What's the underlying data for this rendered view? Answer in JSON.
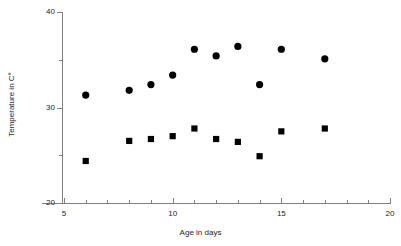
{
  "chart_data": {
    "type": "scatter",
    "title": "",
    "xlabel": "Age in days",
    "ylabel": "Temperature in C°",
    "xlim": [
      4,
      20
    ],
    "ylim": [
      20,
      40
    ],
    "grid": false,
    "legend": "none",
    "x_ticks_major": [
      5,
      10,
      15,
      20
    ],
    "x_tick_labels": [
      "5",
      "10",
      "15",
      "20"
    ],
    "x_ticks_minor": [
      6,
      7,
      8,
      9,
      11,
      12,
      13,
      14,
      16,
      17,
      18,
      19
    ],
    "y_ticks_major": [
      20,
      30,
      40
    ],
    "y_tick_labels": [
      "20",
      "30",
      "40"
    ],
    "y_ticks_minor": [
      25,
      35
    ],
    "marker_color": "#000000",
    "axis_color": "#808080",
    "series": [
      {
        "name": "circles",
        "marker": "circle",
        "x": [
          6,
          8,
          9,
          10,
          11,
          12,
          13,
          14,
          15,
          17
        ],
        "values": [
          31.3,
          31.8,
          32.4,
          33.4,
          36.1,
          35.4,
          36.4,
          32.4,
          36.1,
          35.1
        ]
      },
      {
        "name": "squares",
        "marker": "square",
        "x": [
          6,
          8,
          9,
          10,
          11,
          12,
          13,
          14,
          15,
          17
        ],
        "values": [
          24.4,
          26.5,
          26.7,
          27.0,
          27.8,
          26.7,
          26.4,
          24.9,
          27.5,
          27.8
        ]
      }
    ]
  }
}
